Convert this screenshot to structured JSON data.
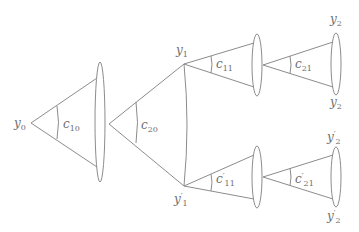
{
  "diagram": {
    "title": "",
    "colors": {
      "stroke": "#8c8c8c",
      "label": "#6e6e6e",
      "background": "#ffffff"
    },
    "nodes": {
      "y0": {
        "base": "y",
        "sub": "0",
        "prime": ""
      },
      "y1": {
        "base": "y",
        "sub": "1",
        "prime": ""
      },
      "y1p": {
        "base": "y",
        "sub": "1",
        "prime": "′"
      },
      "y2_top": {
        "base": "y",
        "sub": "2",
        "prime": ""
      },
      "y2_bot": {
        "base": "y",
        "sub": "2",
        "prime": ""
      },
      "y2p_top": {
        "base": "y",
        "sub": "2",
        "prime": "′"
      },
      "y2p_bot": {
        "base": "y",
        "sub": "2",
        "prime": "′"
      }
    },
    "cones": [
      {
        "id": "c10",
        "base": "c",
        "sub": "10",
        "prime": ""
      },
      {
        "id": "c20",
        "base": "c",
        "sub": "20",
        "prime": ""
      },
      {
        "id": "c11",
        "base": "c",
        "sub": "11",
        "prime": ""
      },
      {
        "id": "c21",
        "base": "c",
        "sub": "21",
        "prime": ""
      },
      {
        "id": "c11p",
        "base": "c",
        "sub": "11",
        "prime": "′"
      },
      {
        "id": "c21p",
        "base": "c",
        "sub": "21",
        "prime": "′"
      }
    ]
  }
}
